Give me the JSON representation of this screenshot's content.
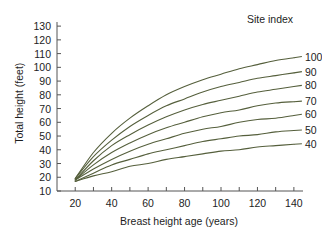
{
  "chart_data": {
    "type": "line",
    "title": "",
    "xlabel": "Breast height age (years)",
    "ylabel": "Total height (feet)",
    "xlim": [
      10,
      145
    ],
    "ylim": [
      10,
      133
    ],
    "xticks": [
      20,
      40,
      60,
      80,
      100,
      120,
      140
    ],
    "xminor_step": 10,
    "yticks": [
      10,
      20,
      30,
      40,
      50,
      60,
      70,
      80,
      90,
      100,
      110,
      120,
      130
    ],
    "grid": false,
    "legend_position": "right-of-plot-line-labels",
    "legend_title": "Site index",
    "line_color": "#555f3c",
    "axis_color": "#555555",
    "text_color": "#1d1d1d",
    "x": [
      20,
      30,
      40,
      50,
      60,
      70,
      80,
      90,
      100,
      110,
      120,
      130,
      140
    ],
    "series": [
      {
        "name": "100",
        "label": "100",
        "values": [
          19,
          38,
          52,
          63,
          72,
          80,
          86,
          91,
          95,
          99,
          102,
          105,
          107
        ]
      },
      {
        "name": "90",
        "label": "90",
        "values": [
          19,
          35,
          47,
          57,
          65,
          72,
          77,
          82,
          86,
          89,
          92,
          94,
          96
        ]
      },
      {
        "name": "80",
        "label": "80",
        "values": [
          18,
          32,
          43,
          51,
          58,
          64,
          69,
          73,
          76,
          79,
          82,
          84,
          86
        ]
      },
      {
        "name": "70",
        "label": "70",
        "values": [
          18,
          29,
          38,
          45,
          51,
          56,
          60,
          64,
          67,
          69,
          72,
          74,
          75
        ]
      },
      {
        "name": "60",
        "label": "60",
        "values": [
          18,
          26,
          33,
          39,
          44,
          48,
          52,
          55,
          57,
          60,
          62,
          63,
          65
        ]
      },
      {
        "name": "50",
        "label": "50",
        "values": [
          17,
          23,
          29,
          33,
          37,
          40,
          43,
          46,
          48,
          50,
          51,
          53,
          54
        ]
      },
      {
        "name": "40",
        "label": "40",
        "values": [
          17,
          21,
          24,
          28,
          30,
          33,
          35,
          37,
          39,
          40,
          42,
          43,
          44
        ]
      }
    ]
  },
  "axes": {
    "ylabel": "Total height (feet)",
    "xlabel": "Breast height age (years)",
    "yticks": [
      "130",
      "120",
      "110",
      "100",
      "90",
      "80",
      "70",
      "60",
      "50",
      "40",
      "30",
      "20",
      "10"
    ],
    "xticks": [
      "20",
      "40",
      "60",
      "80",
      "100",
      "120",
      "140"
    ]
  },
  "legend": {
    "title": "Site index",
    "labels": [
      "100",
      "90",
      "80",
      "70",
      "60",
      "50",
      "40"
    ]
  }
}
